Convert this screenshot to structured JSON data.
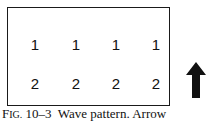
{
  "figure": {
    "rows": [
      {
        "label": "row-1",
        "values": [
          "1",
          "1",
          "1",
          "1"
        ]
      },
      {
        "label": "row-2",
        "values": [
          "2",
          "2",
          "2",
          "2"
        ]
      }
    ],
    "arrow_direction": "up",
    "caption": {
      "fig_first": "F",
      "fig_rest": "IG.",
      "number": "10–3",
      "text": "Wave pattern. Arrow"
    }
  }
}
